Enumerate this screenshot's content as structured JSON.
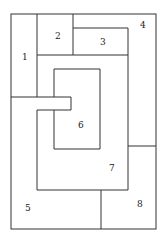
{
  "diagram": {
    "type": "region-partition",
    "labels": [
      {
        "id": "1",
        "text": "1",
        "x": 22,
        "y": 60
      },
      {
        "id": "2",
        "text": "2",
        "x": 55,
        "y": 39
      },
      {
        "id": "3",
        "text": "3",
        "x": 100,
        "y": 45
      },
      {
        "id": "4",
        "text": "4",
        "x": 140,
        "y": 28
      },
      {
        "id": "5",
        "text": "5",
        "x": 25,
        "y": 211
      },
      {
        "id": "6",
        "text": "6",
        "x": 78,
        "y": 128
      },
      {
        "id": "7",
        "text": "7",
        "x": 109,
        "y": 171
      },
      {
        "id": "8",
        "text": "8",
        "x": 137,
        "y": 207
      }
    ],
    "stroke_color": "#333333"
  }
}
